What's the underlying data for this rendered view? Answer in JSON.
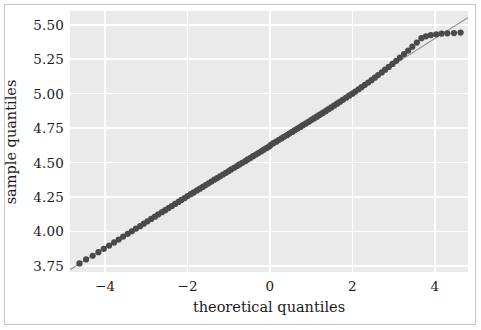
{
  "figure": {
    "background_color": "#ffffff",
    "border_color": "#c9c9c9",
    "plot_background_color": "#eaeaea",
    "gridline_color": "#ffffff"
  },
  "chart_data": {
    "type": "scatter",
    "title": "",
    "xlabel": "theoretical quantiles",
    "ylabel": "sample quantiles",
    "xlim": [
      -4.85,
      4.8
    ],
    "ylim": [
      3.705,
      5.6
    ],
    "xticks": [
      -4,
      -2,
      0,
      2,
      4
    ],
    "xtick_labels": [
      "−4",
      "−2",
      "0",
      "2",
      "4"
    ],
    "yticks": [
      3.75,
      4.0,
      4.25,
      4.5,
      4.75,
      5.0,
      5.25,
      5.5
    ],
    "ytick_labels": [
      "3.75",
      "4.00",
      "4.25",
      "4.50",
      "4.75",
      "5.00",
      "5.25",
      "5.50"
    ],
    "grid": true,
    "legend": null,
    "marker_color": "#4a4a4a",
    "reference_line_color": "#9a9a9a",
    "reference_line": {
      "x": [
        -4.85,
        4.8
      ],
      "y": [
        3.7219,
        5.5528
      ],
      "slope": 0.1897,
      "intercept": 4.6419
    },
    "series": [
      {
        "name": "sample vs theoretical quantiles",
        "x": [
          -4.62,
          -4.46,
          -4.3,
          -4.16,
          -4.03,
          -3.9,
          -3.78,
          -3.67,
          -3.56,
          -3.45,
          -3.35,
          -3.25,
          -3.15,
          -3.06,
          -2.97,
          -2.88,
          -2.79,
          -2.71,
          -2.62,
          -2.54,
          -2.46,
          -2.38,
          -2.3,
          -2.22,
          -2.15,
          -2.07,
          -2.0,
          -1.92,
          -1.85,
          -1.77,
          -1.7,
          -1.63,
          -1.56,
          -1.49,
          -1.42,
          -1.35,
          -1.28,
          -1.21,
          -1.14,
          -1.07,
          -1.0,
          -0.94,
          -0.87,
          -0.8,
          -0.74,
          -0.67,
          -0.6,
          -0.54,
          -0.47,
          -0.41,
          -0.34,
          -0.28,
          -0.21,
          -0.15,
          -0.08,
          -0.02,
          0.02,
          0.08,
          0.15,
          0.21,
          0.28,
          0.34,
          0.41,
          0.47,
          0.54,
          0.6,
          0.67,
          0.74,
          0.8,
          0.87,
          0.94,
          1.0,
          1.07,
          1.14,
          1.21,
          1.28,
          1.35,
          1.42,
          1.49,
          1.56,
          1.63,
          1.7,
          1.77,
          1.85,
          1.92,
          2.0,
          2.07,
          2.15,
          2.22,
          2.3,
          2.38,
          2.46,
          2.54,
          2.62,
          2.71,
          2.79,
          2.88,
          2.97,
          3.06,
          3.15,
          3.25,
          3.35,
          3.45,
          3.56,
          3.67,
          3.78,
          3.9,
          4.03,
          4.16,
          4.3,
          4.46,
          4.62
        ],
        "y": [
          3.767,
          3.796,
          3.823,
          3.849,
          3.873,
          3.897,
          3.92,
          3.941,
          3.962,
          3.982,
          4.001,
          4.02,
          4.038,
          4.056,
          4.073,
          4.09,
          4.107,
          4.123,
          4.139,
          4.154,
          4.169,
          4.184,
          4.199,
          4.214,
          4.228,
          4.242,
          4.256,
          4.27,
          4.283,
          4.297,
          4.31,
          4.323,
          4.336,
          4.349,
          4.362,
          4.375,
          4.387,
          4.4,
          4.413,
          4.425,
          4.438,
          4.45,
          4.462,
          4.474,
          4.486,
          4.498,
          4.51,
          4.522,
          4.534,
          4.546,
          4.558,
          4.569,
          4.581,
          4.593,
          4.605,
          4.616,
          4.628,
          4.64,
          4.651,
          4.663,
          4.675,
          4.687,
          4.698,
          4.71,
          4.722,
          4.734,
          4.746,
          4.758,
          4.771,
          4.783,
          4.795,
          4.808,
          4.82,
          4.833,
          4.846,
          4.859,
          4.872,
          4.886,
          4.899,
          4.913,
          4.927,
          4.941,
          4.955,
          4.97,
          4.985,
          5.0,
          5.015,
          5.031,
          5.047,
          5.064,
          5.081,
          5.098,
          5.116,
          5.135,
          5.154,
          5.174,
          5.194,
          5.216,
          5.238,
          5.262,
          5.287,
          5.313,
          5.341,
          5.371,
          5.403,
          5.416,
          5.425,
          5.431,
          5.436,
          5.438,
          5.44,
          5.443
        ]
      }
    ]
  }
}
